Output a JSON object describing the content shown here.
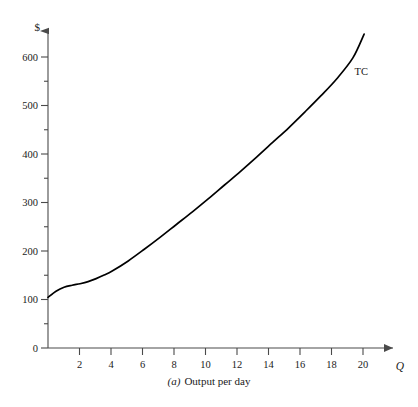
{
  "chart_data": {
    "type": "line",
    "title": "",
    "subtitle": "",
    "caption_letter": "(a)",
    "caption_text": "Output per day",
    "xlabel": "Q",
    "ylabel": "$",
    "xlim": [
      0,
      21.5
    ],
    "ylim": [
      0,
      640
    ],
    "grid": false,
    "legend_position": "inline-right",
    "x_ticks": [
      2,
      4,
      6,
      8,
      10,
      12,
      14,
      16,
      18,
      20
    ],
    "x_tick_labels": [
      "2",
      "4",
      "6",
      "8",
      "10",
      "12",
      "14",
      "16",
      "18",
      "20"
    ],
    "x_minor_ticks": [],
    "y_ticks": [
      0,
      100,
      200,
      300,
      400,
      500,
      600
    ],
    "y_tick_labels": [
      "0",
      "100",
      "200",
      "300",
      "400",
      "500",
      "600"
    ],
    "y_minor_ticks": [
      50,
      150,
      250,
      350,
      450,
      550
    ],
    "series": [
      {
        "name": "TC",
        "label": "TC",
        "color": "#000000",
        "annotation": "TC",
        "x": [
          0,
          0.5,
          1,
          1.5,
          2,
          2.5,
          3,
          3.5,
          4,
          5,
          6,
          7,
          8,
          9,
          10,
          11,
          12,
          13,
          14,
          15,
          16,
          17,
          18,
          19,
          19.7
        ],
        "values": [
          100,
          112,
          120,
          124,
          127,
          131,
          137,
          144,
          152,
          172,
          195,
          219,
          244,
          269,
          295,
          322,
          349,
          377,
          406,
          435,
          466,
          498,
          532,
          573,
          620
        ]
      }
    ],
    "annotations": [
      {
        "text": "TC",
        "x": 19.1,
        "y": 540
      }
    ]
  },
  "axes": {
    "y_axis_symbol": "$",
    "x_axis_symbol": "Q"
  }
}
